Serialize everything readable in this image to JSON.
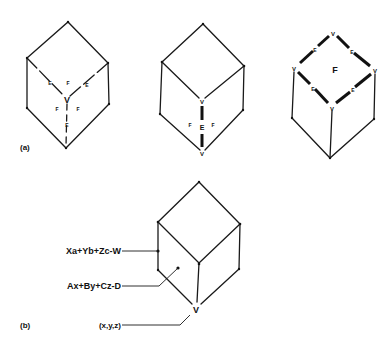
{
  "figure": {
    "part_a": {
      "label": "(a)",
      "cube_vertex": {
        "center_label": "V",
        "face_labels": [
          "F",
          "F",
          "F"
        ],
        "edge_labels": [
          "E",
          "E",
          "E"
        ]
      },
      "cube_edge": {
        "center_label": "E",
        "vertex_labels": [
          "V",
          "V"
        ],
        "face_labels": [
          "F",
          "F"
        ]
      },
      "cube_face": {
        "center_label": "F",
        "vertex_labels": [
          "V",
          "V",
          "V",
          "V"
        ],
        "edge_labels": [
          "E",
          "E",
          "E",
          "E"
        ]
      }
    },
    "part_b": {
      "label": "(b)",
      "vertex_label": "V",
      "annotations": [
        {
          "text": "Xa+Yb+Zc-W",
          "target": "edge"
        },
        {
          "text": "Ax+By+Cz-D",
          "target": "face"
        },
        {
          "text": "(x,y,z)",
          "target": "vertex"
        }
      ]
    }
  }
}
